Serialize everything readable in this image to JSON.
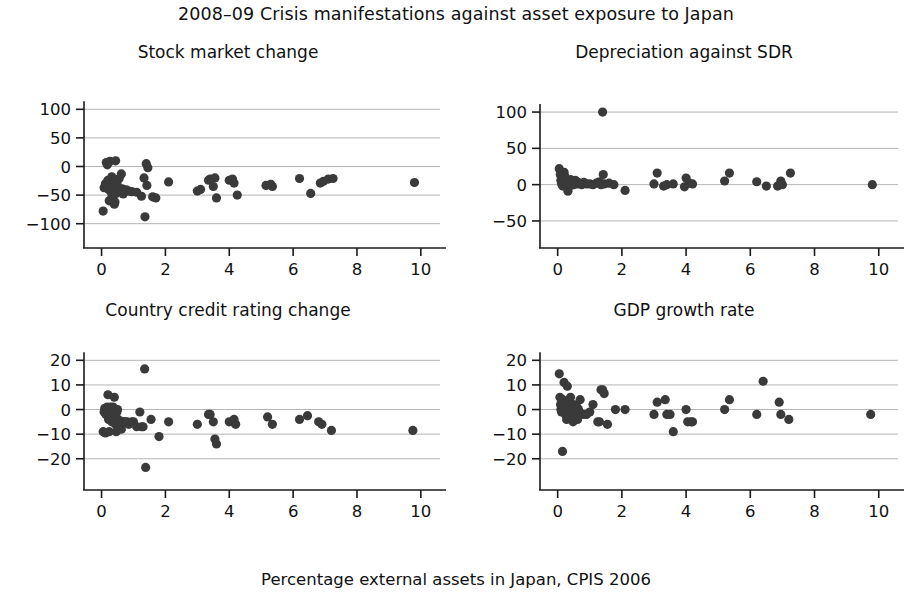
{
  "figure": {
    "title": "2008–09 Crisis manifestations against asset exposure to Japan",
    "xlabel": "Percentage external assets in Japan, CPIS 2006",
    "marker_color": "#3a3a3a",
    "grid_color": "#b4b4b4",
    "background": "#ffffff"
  },
  "chart_data": [
    {
      "type": "scatter",
      "title": "Stock market change",
      "xlabel": "",
      "ylabel": "",
      "xlim": [
        -0.55,
        10.6
      ],
      "ylim": [
        -118,
        118
      ],
      "xticks": [
        0,
        2,
        4,
        6,
        8,
        10
      ],
      "yticks": [
        100,
        50,
        0,
        -50,
        -100
      ],
      "xticklabels": [
        "0",
        "2",
        "4",
        "6",
        "8",
        "10"
      ],
      "yticklabels": [
        "100",
        "50",
        "0",
        "−50",
        "−100"
      ],
      "grid": "horizontal",
      "legend": "none",
      "points": [
        [
          0.05,
          -78
        ],
        [
          0.08,
          -37
        ],
        [
          0.12,
          -30
        ],
        [
          0.15,
          7
        ],
        [
          0.18,
          3
        ],
        [
          0.2,
          -24
        ],
        [
          0.22,
          -40
        ],
        [
          0.24,
          -60
        ],
        [
          0.26,
          9
        ],
        [
          0.28,
          -33
        ],
        [
          0.3,
          -45
        ],
        [
          0.32,
          -18
        ],
        [
          0.33,
          -52
        ],
        [
          0.35,
          -41
        ],
        [
          0.36,
          -26
        ],
        [
          0.38,
          -38
        ],
        [
          0.4,
          -66
        ],
        [
          0.42,
          -62
        ],
        [
          0.44,
          10
        ],
        [
          0.46,
          -47
        ],
        [
          0.48,
          -29
        ],
        [
          0.5,
          -44
        ],
        [
          0.52,
          -36
        ],
        [
          0.55,
          -21
        ],
        [
          0.58,
          -40
        ],
        [
          0.6,
          -43
        ],
        [
          0.62,
          -13
        ],
        [
          0.65,
          -39
        ],
        [
          0.68,
          -48
        ],
        [
          0.72,
          -42
        ],
        [
          0.78,
          -41
        ],
        [
          0.85,
          -43
        ],
        [
          0.95,
          -44
        ],
        [
          1.1,
          -45
        ],
        [
          1.25,
          -52
        ],
        [
          1.33,
          -20
        ],
        [
          1.36,
          -88
        ],
        [
          1.4,
          5
        ],
        [
          1.42,
          -33
        ],
        [
          1.45,
          -2
        ],
        [
          1.6,
          -53
        ],
        [
          1.7,
          -55
        ],
        [
          2.1,
          -27
        ],
        [
          3.0,
          -43
        ],
        [
          3.1,
          -40
        ],
        [
          3.35,
          -24
        ],
        [
          3.4,
          -22
        ],
        [
          3.5,
          -35
        ],
        [
          3.55,
          -20
        ],
        [
          3.6,
          -55
        ],
        [
          4.0,
          -24
        ],
        [
          4.1,
          -22
        ],
        [
          4.15,
          -29
        ],
        [
          4.25,
          -50
        ],
        [
          5.15,
          -33
        ],
        [
          5.3,
          -31
        ],
        [
          5.35,
          -35
        ],
        [
          6.2,
          -21
        ],
        [
          6.55,
          -47
        ],
        [
          6.85,
          -29
        ],
        [
          6.95,
          -26
        ],
        [
          7.1,
          -22
        ],
        [
          7.25,
          -21
        ],
        [
          9.8,
          -28
        ]
      ]
    },
    {
      "type": "scatter",
      "title": "Depreciation against SDR",
      "xlabel": "",
      "ylabel": "",
      "xlim": [
        -0.55,
        10.6
      ],
      "ylim": [
        -68,
        118
      ],
      "xticks": [
        0,
        2,
        4,
        6,
        8,
        10
      ],
      "yticks": [
        100,
        50,
        0,
        -50
      ],
      "xticklabels": [
        "0",
        "2",
        "4",
        "6",
        "8",
        "10"
      ],
      "yticklabels": [
        "100",
        "50",
        "0",
        "−50"
      ],
      "grid": "horizontal",
      "legend": "none",
      "points": [
        [
          0.05,
          22
        ],
        [
          0.08,
          14
        ],
        [
          0.1,
          6
        ],
        [
          0.12,
          2
        ],
        [
          0.14,
          0
        ],
        [
          0.16,
          -2
        ],
        [
          0.18,
          1
        ],
        [
          0.2,
          17
        ],
        [
          0.22,
          12
        ],
        [
          0.24,
          4
        ],
        [
          0.26,
          0
        ],
        [
          0.28,
          -1
        ],
        [
          0.3,
          2
        ],
        [
          0.32,
          -9
        ],
        [
          0.34,
          5
        ],
        [
          0.36,
          1
        ],
        [
          0.38,
          0
        ],
        [
          0.4,
          7
        ],
        [
          0.42,
          -1
        ],
        [
          0.45,
          3
        ],
        [
          0.48,
          2
        ],
        [
          0.5,
          0
        ],
        [
          0.55,
          6
        ],
        [
          0.6,
          4
        ],
        [
          0.62,
          1
        ],
        [
          0.68,
          2
        ],
        [
          0.75,
          0
        ],
        [
          0.82,
          3
        ],
        [
          0.9,
          1
        ],
        [
          1.0,
          1
        ],
        [
          1.1,
          0
        ],
        [
          1.2,
          2
        ],
        [
          1.3,
          4
        ],
        [
          1.35,
          0
        ],
        [
          1.4,
          100
        ],
        [
          1.42,
          14
        ],
        [
          1.45,
          1
        ],
        [
          1.6,
          2
        ],
        [
          1.75,
          0
        ],
        [
          2.1,
          -8
        ],
        [
          3.0,
          1
        ],
        [
          3.1,
          16
        ],
        [
          3.3,
          -2
        ],
        [
          3.4,
          0
        ],
        [
          3.6,
          1
        ],
        [
          3.95,
          -3
        ],
        [
          4.0,
          9
        ],
        [
          4.1,
          2
        ],
        [
          4.2,
          1
        ],
        [
          5.2,
          5
        ],
        [
          5.35,
          16
        ],
        [
          6.2,
          4
        ],
        [
          6.5,
          -2
        ],
        [
          6.85,
          -2
        ],
        [
          6.95,
          5
        ],
        [
          7.0,
          0
        ],
        [
          7.25,
          16
        ],
        [
          9.8,
          0
        ]
      ]
    },
    {
      "type": "scatter",
      "title": "Country credit rating change",
      "xlabel": "",
      "ylabel": "",
      "xlim": [
        -0.55,
        10.6
      ],
      "ylim": [
        -27,
        25
      ],
      "xticks": [
        0,
        2,
        4,
        6,
        8,
        10
      ],
      "yticks": [
        20,
        10,
        0,
        -10,
        -20
      ],
      "xticklabels": [
        "0",
        "2",
        "4",
        "6",
        "8",
        "10"
      ],
      "yticklabels": [
        "20",
        "10",
        "0",
        "−10",
        "−20"
      ],
      "grid": "horizontal",
      "legend": "none",
      "points": [
        [
          0.05,
          -9
        ],
        [
          0.08,
          -1
        ],
        [
          0.1,
          0.5
        ],
        [
          0.12,
          -9.5
        ],
        [
          0.14,
          -2
        ],
        [
          0.16,
          0
        ],
        [
          0.18,
          1
        ],
        [
          0.2,
          6
        ],
        [
          0.22,
          -4
        ],
        [
          0.24,
          -9
        ],
        [
          0.26,
          0
        ],
        [
          0.28,
          1
        ],
        [
          0.3,
          -2
        ],
        [
          0.32,
          -5
        ],
        [
          0.34,
          0
        ],
        [
          0.36,
          1
        ],
        [
          0.38,
          0.5
        ],
        [
          0.4,
          5
        ],
        [
          0.42,
          -5
        ],
        [
          0.44,
          -6
        ],
        [
          0.46,
          -9
        ],
        [
          0.48,
          -1
        ],
        [
          0.5,
          0
        ],
        [
          0.52,
          -4
        ],
        [
          0.55,
          -6
        ],
        [
          0.6,
          -5
        ],
        [
          0.62,
          -8
        ],
        [
          0.65,
          -5
        ],
        [
          0.7,
          -5
        ],
        [
          0.75,
          -5
        ],
        [
          0.8,
          -5
        ],
        [
          0.85,
          -6
        ],
        [
          0.95,
          -5
        ],
        [
          1.0,
          -5
        ],
        [
          1.1,
          -7
        ],
        [
          1.2,
          -1
        ],
        [
          1.25,
          -7
        ],
        [
          1.3,
          -7
        ],
        [
          1.35,
          16.5
        ],
        [
          1.38,
          -23.5
        ],
        [
          1.55,
          -4
        ],
        [
          1.8,
          -11
        ],
        [
          2.1,
          -5
        ],
        [
          3.0,
          -6
        ],
        [
          3.35,
          -2
        ],
        [
          3.4,
          -2
        ],
        [
          3.5,
          -5
        ],
        [
          3.55,
          -12
        ],
        [
          3.6,
          -14
        ],
        [
          4.0,
          -5
        ],
        [
          4.1,
          -5
        ],
        [
          4.15,
          -4
        ],
        [
          4.2,
          -6
        ],
        [
          5.2,
          -3
        ],
        [
          5.35,
          -6
        ],
        [
          6.2,
          -4
        ],
        [
          6.45,
          -2.5
        ],
        [
          6.8,
          -5
        ],
        [
          6.9,
          -6
        ],
        [
          7.2,
          -8.5
        ],
        [
          9.75,
          -8.5
        ]
      ]
    },
    {
      "type": "scatter",
      "title": "GDP growth rate",
      "xlabel": "",
      "ylabel": "",
      "xlim": [
        -0.55,
        10.6
      ],
      "ylim": [
        -27,
        25
      ],
      "xticks": [
        0,
        2,
        4,
        6,
        8,
        10
      ],
      "yticks": [
        20,
        10,
        0,
        -10,
        -20
      ],
      "xticklabels": [
        "0",
        "2",
        "4",
        "6",
        "8",
        "10"
      ],
      "yticklabels": [
        "20",
        "10",
        "0",
        "−10",
        "−20"
      ],
      "grid": "horizontal",
      "legend": "none",
      "points": [
        [
          0.05,
          14.5
        ],
        [
          0.07,
          5
        ],
        [
          0.09,
          2
        ],
        [
          0.1,
          0
        ],
        [
          0.12,
          -1
        ],
        [
          0.14,
          1
        ],
        [
          0.15,
          -17
        ],
        [
          0.16,
          4
        ],
        [
          0.18,
          0.5
        ],
        [
          0.2,
          11
        ],
        [
          0.22,
          2
        ],
        [
          0.24,
          -2
        ],
        [
          0.26,
          0
        ],
        [
          0.28,
          -4
        ],
        [
          0.3,
          9.5
        ],
        [
          0.32,
          3
        ],
        [
          0.34,
          1
        ],
        [
          0.36,
          -1
        ],
        [
          0.38,
          0
        ],
        [
          0.4,
          5
        ],
        [
          0.42,
          -3
        ],
        [
          0.44,
          0
        ],
        [
          0.46,
          1
        ],
        [
          0.48,
          -5
        ],
        [
          0.5,
          2
        ],
        [
          0.52,
          0
        ],
        [
          0.55,
          -1
        ],
        [
          0.6,
          1
        ],
        [
          0.62,
          -4
        ],
        [
          0.65,
          0
        ],
        [
          0.7,
          4
        ],
        [
          0.8,
          -2
        ],
        [
          0.9,
          -2
        ],
        [
          1.0,
          -1
        ],
        [
          1.1,
          2
        ],
        [
          1.25,
          -5
        ],
        [
          1.3,
          -5
        ],
        [
          1.35,
          8
        ],
        [
          1.4,
          8
        ],
        [
          1.45,
          6.5
        ],
        [
          1.55,
          -6
        ],
        [
          1.8,
          0
        ],
        [
          2.1,
          0
        ],
        [
          3.0,
          -2
        ],
        [
          3.1,
          3
        ],
        [
          3.35,
          4
        ],
        [
          3.4,
          -2
        ],
        [
          3.5,
          -2
        ],
        [
          3.6,
          -9
        ],
        [
          4.0,
          0
        ],
        [
          4.05,
          -5
        ],
        [
          4.15,
          -5
        ],
        [
          4.2,
          -5
        ],
        [
          5.2,
          0
        ],
        [
          5.35,
          4
        ],
        [
          6.4,
          11.5
        ],
        [
          6.2,
          -2
        ],
        [
          6.9,
          3
        ],
        [
          6.95,
          -2
        ],
        [
          7.2,
          -4
        ],
        [
          9.75,
          -2
        ]
      ]
    }
  ]
}
